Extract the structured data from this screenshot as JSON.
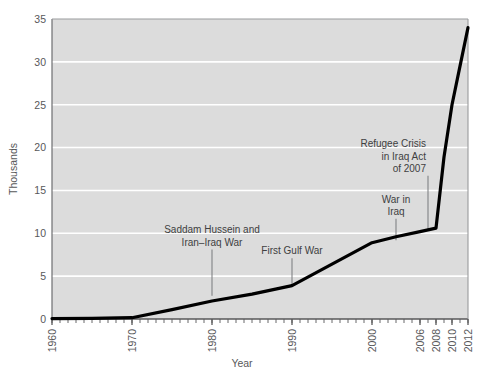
{
  "chart_data": {
    "type": "line",
    "title": "",
    "xlabel": "Year",
    "ylabel": "Thousands",
    "xlim": [
      1960,
      2012
    ],
    "ylim": [
      0,
      35
    ],
    "grid": true,
    "legend": "none",
    "x_ticks": [
      "1960",
      "1970",
      "1980",
      "1990",
      "2000",
      "2006",
      "2008",
      "2010",
      "2012"
    ],
    "x_tick_values": [
      1960,
      1970,
      1980,
      1990,
      2000,
      2006,
      2008,
      2010,
      2012
    ],
    "y_ticks": [
      "0",
      "5",
      "10",
      "15",
      "20",
      "25",
      "30",
      "35"
    ],
    "y_tick_values": [
      0,
      5,
      10,
      15,
      20,
      25,
      30,
      35
    ],
    "series": [
      {
        "name": "Iraqi refugee admissions",
        "color": "#000000",
        "x": [
          1960,
          1965,
          1970,
          1975,
          1980,
          1985,
          1990,
          1995,
          2000,
          2003,
          2006,
          2008,
          2009,
          2010,
          2011,
          2012
        ],
        "y": [
          0.05,
          0.08,
          0.15,
          1.1,
          2.1,
          2.9,
          3.9,
          6.4,
          8.9,
          9.6,
          10.2,
          10.6,
          18.9,
          25.0,
          29.5,
          34.0
        ]
      }
    ],
    "annotations": [
      {
        "id": "saddam-iran-iraq-war",
        "lines": [
          "Saddam Hussein and",
          "Iran–Iraq War"
        ],
        "align": "center",
        "leader_x": 1980,
        "leader_y_top": 8.1,
        "leader_y_bottom": 2.7
      },
      {
        "id": "first-gulf-war",
        "lines": [
          "First Gulf War"
        ],
        "align": "center",
        "leader_x": 1990,
        "leader_y_top": 7.1,
        "leader_y_bottom": 4.0
      },
      {
        "id": "war-in-iraq",
        "lines": [
          "War in",
          "Iraq"
        ],
        "align": "center",
        "leader_x": 2003,
        "leader_y_top": 11.7,
        "leader_y_bottom": 9.2
      },
      {
        "id": "refugee-crisis-in-iraq-act",
        "lines": [
          "Refugee Crisis",
          "in Iraq Act",
          "of 2007"
        ],
        "align": "right",
        "leader_x": 2007,
        "leader_y_top": 16.7,
        "leader_y_bottom": 10.4
      }
    ],
    "style": {
      "plot_background": "#dcdcdc",
      "grid_color": "#ffffff",
      "axis_color": "#6d6e71",
      "line_color": "#000000",
      "text_color": "#58585a",
      "page_background": "#ffffff"
    }
  }
}
